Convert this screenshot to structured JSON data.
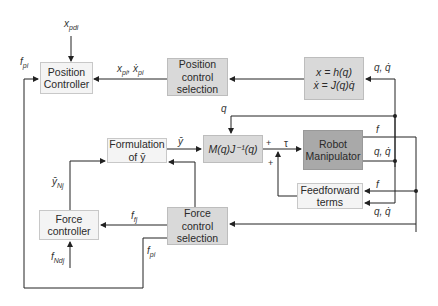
{
  "blocks": {
    "position_controller": "Position\nController",
    "position_control_selection": "Position\ncontrol\nselection",
    "kinematics": "x = h(q)\nẋ = J(q)q̇",
    "formulation": "Formulation\nof ȳ",
    "inertia": "M(q)J⁻¹(q)",
    "robot": "Robot\nManipulator",
    "feedforward": "Feedforward\nterms",
    "force_controller": "Force\ncontroller",
    "force_control_selection": "Force\ncontrol\nselection"
  },
  "signals": {
    "x_pdi": "x",
    "x_pdi_sub": "pdi",
    "f_pi_top": "f",
    "f_pi_top_sub": "pi",
    "x_pi": "x",
    "x_pi_sub": "pi",
    "x_pi_sep": ", ẋ",
    "x_pi_sub2": "pi",
    "q_qdot_kin": "q, q̇",
    "q_top": "q",
    "y_bar": "ȳ",
    "tau": "τ",
    "plus1": "+",
    "plus2": "+",
    "f_robot": "f",
    "q_qdot_robot": "q, q̇",
    "f_ff": "f",
    "q_qdot_ff": "q, q̇",
    "y_Nj": "ȳ",
    "y_Nj_sub": "Nj",
    "f_fj": "f",
    "f_fj_sub": "fj",
    "f_Ndj": "f",
    "f_Ndj_sub": "Ndj",
    "f_pi_bottom": "f",
    "f_pi_bottom_sub": "pi"
  },
  "colors": {
    "light_block": "#f4f4f4",
    "mid_block": "#d9d9d9",
    "dark_block": "#a9a9a9",
    "wire": "#222222"
  }
}
